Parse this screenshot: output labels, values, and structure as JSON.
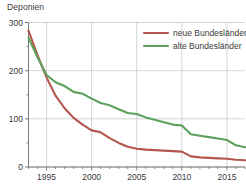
{
  "chart_data": {
    "type": "line",
    "title": "Deponien",
    "xlabel": "",
    "ylabel": "",
    "xlim": [
      1993,
      2017
    ],
    "ylim": [
      0,
      300
    ],
    "yticks": [
      0,
      100,
      200,
      300
    ],
    "ytick_labels": [
      "0",
      "100",
      "200",
      "300"
    ],
    "yminor": [
      50,
      150,
      250
    ],
    "xticks": [
      1995,
      2000,
      2005,
      2010,
      2015
    ],
    "xtick_labels": [
      "1995",
      "2000",
      "2005",
      "2010",
      "2015"
    ],
    "xminor_step": 1,
    "grid": true,
    "legend_position": "top-right",
    "x": [
      1993,
      1994,
      1995,
      1996,
      1997,
      1998,
      1999,
      2000,
      2001,
      2002,
      2003,
      2004,
      2005,
      2006,
      2007,
      2008,
      2009,
      2010,
      2011,
      2012,
      2013,
      2014,
      2015,
      2016,
      2017
    ],
    "series": [
      {
        "name": "neue Bundesländer",
        "color": "#b4564b",
        "values": [
          283,
          232,
          186,
          148,
          122,
          102,
          88,
          76,
          72,
          60,
          50,
          42,
          38,
          36,
          35,
          34,
          33,
          32,
          22,
          20,
          19,
          18,
          17,
          15,
          14
        ]
      },
      {
        "name": "alte Bundesländer",
        "color": "#5ba05b",
        "values": [
          268,
          228,
          191,
          176,
          168,
          156,
          152,
          142,
          133,
          128,
          120,
          112,
          110,
          103,
          98,
          93,
          88,
          86,
          68,
          65,
          62,
          59,
          56,
          45,
          41
        ]
      }
    ]
  },
  "legend": {
    "items": [
      {
        "label": "neue Bundesländer",
        "color": "#b4564b"
      },
      {
        "label": "alte Bundesländer",
        "color": "#5ba05b"
      }
    ]
  }
}
